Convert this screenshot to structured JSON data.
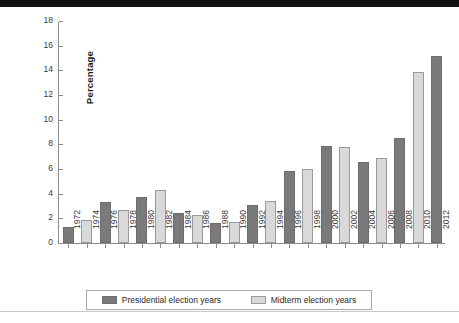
{
  "chart_data": {
    "type": "bar",
    "title": "",
    "xlabel": "",
    "ylabel": "Percentage",
    "ylim": [
      0,
      18
    ],
    "ytick_step": 2,
    "yticks": [
      0,
      2,
      4,
      6,
      8,
      10,
      12,
      14,
      16,
      18
    ],
    "grid": false,
    "legend_position": "bottom",
    "categories": [
      "1972",
      "1974",
      "1976",
      "1978",
      "1980",
      "1982",
      "1984",
      "1986",
      "1988",
      "1990",
      "1992",
      "1994",
      "1996",
      "1998",
      "2000",
      "2002",
      "2004",
      "2006",
      "2008",
      "2010",
      "2012"
    ],
    "series": [
      {
        "name": "Presidential election years",
        "color": "#7a7a7a",
        "values": [
          1.3,
          null,
          3.3,
          null,
          3.7,
          null,
          2.4,
          null,
          1.6,
          null,
          3.1,
          null,
          5.8,
          null,
          7.9,
          null,
          6.6,
          null,
          8.5,
          null,
          15.2
        ]
      },
      {
        "name": "Midterm election years",
        "color": "#d9d9d9",
        "values": [
          null,
          1.9,
          null,
          2.7,
          null,
          4.3,
          null,
          2.3,
          null,
          1.7,
          null,
          3.4,
          null,
          6.0,
          null,
          7.8,
          null,
          6.9,
          null,
          13.9,
          null
        ]
      }
    ],
    "bars": [
      {
        "category": "1972",
        "series": "Presidential election years",
        "value": 1.3
      },
      {
        "category": "1974",
        "series": "Midterm election years",
        "value": 1.9
      },
      {
        "category": "1976",
        "series": "Presidential election years",
        "value": 3.3
      },
      {
        "category": "1978",
        "series": "Midterm election years",
        "value": 2.7
      },
      {
        "category": "1980",
        "series": "Presidential election years",
        "value": 3.7
      },
      {
        "category": "1982",
        "series": "Midterm election years",
        "value": 4.3
      },
      {
        "category": "1984",
        "series": "Presidential election years",
        "value": 2.4
      },
      {
        "category": "1986",
        "series": "Midterm election years",
        "value": 2.3
      },
      {
        "category": "1988",
        "series": "Presidential election years",
        "value": 1.6
      },
      {
        "category": "1990",
        "series": "Midterm election years",
        "value": 1.7
      },
      {
        "category": "1992",
        "series": "Presidential election years",
        "value": 3.1
      },
      {
        "category": "1994",
        "series": "Midterm election years",
        "value": 3.4
      },
      {
        "category": "1996",
        "series": "Presidential election years",
        "value": 5.8
      },
      {
        "category": "1998",
        "series": "Midterm election years",
        "value": 6.0
      },
      {
        "category": "2000",
        "series": "Presidential election years",
        "value": 7.9
      },
      {
        "category": "2002",
        "series": "Midterm election years",
        "value": 7.8
      },
      {
        "category": "2004",
        "series": "Presidential election years",
        "value": 6.6
      },
      {
        "category": "2006",
        "series": "Midterm election years",
        "value": 6.9
      },
      {
        "category": "2008",
        "series": "Presidential election years",
        "value": 8.5
      },
      {
        "category": "2010",
        "series": "Midterm election years",
        "value": 13.9
      },
      {
        "category": "2012",
        "series": "Presidential election years",
        "value": 15.2
      }
    ],
    "legend": [
      {
        "label": "Presidential election years",
        "color": "#7a7a7a"
      },
      {
        "label": "Midterm election years",
        "color": "#d9d9d9"
      }
    ]
  }
}
